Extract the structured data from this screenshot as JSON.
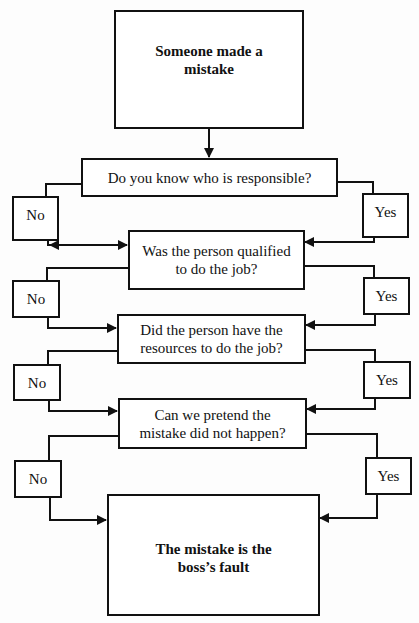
{
  "flowchart": {
    "start": {
      "text": "Someone made a mistake"
    },
    "questions": [
      {
        "text": "Do you know who is responsible?",
        "no_label": "No",
        "yes_label": "Yes"
      },
      {
        "text": "Was the person qualified to do the job?",
        "no_label": "No",
        "yes_label": "Yes"
      },
      {
        "text": "Did the person have the resources to do the job?",
        "no_label": "No",
        "yes_label": "Yes"
      },
      {
        "text": "Can we pretend the mistake did not happen?",
        "no_label": "No",
        "yes_label": "Yes"
      }
    ],
    "end": {
      "text": "The mistake is the boss’s fault"
    }
  },
  "colors": {
    "line": "#111111",
    "background": "#fdfdfd"
  }
}
